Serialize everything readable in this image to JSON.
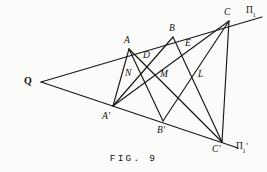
{
  "figure": {
    "caption": "FIG.  9",
    "line_color": "#1a1714",
    "background_color": "#fbfbfa",
    "text_color": "#14120f"
  },
  "points": [
    {
      "id": "Q",
      "label": "Q",
      "style": "upright",
      "x": 41,
      "y": 82,
      "label_x": 24,
      "label_y": 76
    },
    {
      "id": "A",
      "label": "A",
      "style": "italic",
      "x": 129,
      "y": 49,
      "label_x": 124,
      "label_y": 36
    },
    {
      "id": "B",
      "label": "B",
      "style": "italic",
      "x": 173,
      "y": 37,
      "label_x": 169,
      "label_y": 24
    },
    {
      "id": "C",
      "label": "C",
      "style": "italic",
      "x": 229,
      "y": 21,
      "label_x": 224,
      "label_y": 8
    },
    {
      "id": "Ap",
      "label": "A'",
      "style": "italic",
      "x": 113,
      "y": 106,
      "label_x": 102,
      "label_y": 112
    },
    {
      "id": "Bp",
      "label": "B'",
      "style": "italic",
      "x": 163,
      "y": 121,
      "label_x": 157,
      "label_y": 126
    },
    {
      "id": "Cp",
      "label": "C'",
      "style": "italic",
      "x": 222,
      "y": 142,
      "label_x": 212,
      "label_y": 145
    },
    {
      "id": "D",
      "label": "D",
      "style": "italic",
      "x": 145,
      "y": 62,
      "label_x": 143,
      "label_y": 51
    },
    {
      "id": "E",
      "label": "E",
      "style": "italic",
      "x": 189,
      "y": 50,
      "label_x": 185,
      "label_y": 39
    },
    {
      "id": "N",
      "label": "N",
      "style": "italic",
      "x": 133,
      "y": 80,
      "label_x": 125,
      "label_y": 69
    },
    {
      "id": "M",
      "label": "M",
      "style": "italic",
      "x": 168,
      "y": 80,
      "label_x": 160,
      "label_y": 70
    },
    {
      "id": "L",
      "label": "L",
      "style": "italic",
      "x": 205,
      "y": 80,
      "label_x": 198,
      "label_y": 70
    }
  ],
  "plane_labels": [
    {
      "id": "pi1",
      "base": "Π",
      "sub": "1",
      "prime": "",
      "x": 246,
      "y": 6,
      "name": "plane-label-pi1"
    },
    {
      "id": "pi1-prime",
      "base": "Π",
      "sub": "1",
      "prime": "'",
      "x": 236,
      "y": 142,
      "name": "plane-label-pi1-prime"
    }
  ],
  "segments": [
    {
      "id": "q-upper-ray",
      "from": "Q",
      "to": "pi1",
      "x1": 41,
      "y1": 82,
      "x2": 262,
      "y2": 17
    },
    {
      "id": "q-lower-ray",
      "from": "Q",
      "to": "pi1prime",
      "x1": 41,
      "y1": 82,
      "x2": 238,
      "y2": 148
    },
    {
      "id": "a-to-bprime",
      "from": "A",
      "to": "Bp",
      "x1": 129,
      "y1": 49,
      "x2": 163,
      "y2": 121
    },
    {
      "id": "a-to-cprime",
      "from": "A",
      "to": "Cp",
      "x1": 129,
      "y1": 49,
      "x2": 222,
      "y2": 142
    },
    {
      "id": "b-to-aprime",
      "from": "B",
      "to": "Ap",
      "x1": 173,
      "y1": 37,
      "x2": 113,
      "y2": 106
    },
    {
      "id": "b-to-cprime",
      "from": "B",
      "to": "Cp",
      "x1": 173,
      "y1": 37,
      "x2": 222,
      "y2": 142
    },
    {
      "id": "c-to-aprime",
      "from": "C",
      "to": "Ap",
      "x1": 229,
      "y1": 21,
      "x2": 113,
      "y2": 106
    },
    {
      "id": "c-to-bprime",
      "from": "C",
      "to": "Bp",
      "x1": 229,
      "y1": 21,
      "x2": 163,
      "y2": 121
    },
    {
      "id": "c-to-cprime",
      "from": "C",
      "to": "Cp",
      "x1": 229,
      "y1": 21,
      "x2": 222,
      "y2": 142
    },
    {
      "id": "a-to-aprime",
      "from": "A",
      "to": "Ap",
      "x1": 129,
      "y1": 49,
      "x2": 113,
      "y2": 106
    }
  ]
}
